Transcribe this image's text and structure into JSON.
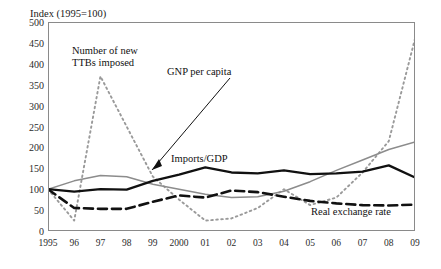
{
  "chart_data": {
    "type": "line",
    "title": "",
    "ylabel": "Index (1995=100)",
    "xlabel": "",
    "ylim": [
      0,
      500
    ],
    "yticks": [
      0,
      50,
      100,
      150,
      200,
      250,
      300,
      350,
      400,
      450,
      500
    ],
    "grid": false,
    "legend_position": "inline-annotations",
    "categories": [
      "1995",
      "96",
      "97",
      "98",
      "99",
      "2000",
      "01",
      "02",
      "03",
      "04",
      "05",
      "06",
      "07",
      "08",
      "09"
    ],
    "x": [
      1995,
      1996,
      1997,
      1998,
      1999,
      2000,
      2001,
      2002,
      2003,
      2004,
      2005,
      2006,
      2007,
      2008,
      2009
    ],
    "series": [
      {
        "name": "Number of new TTBs imposed",
        "style": "dotted",
        "color": "#9a9a9a",
        "values": [
          100,
          25,
          370,
          250,
          130,
          75,
          25,
          30,
          55,
          100,
          62,
          80,
          140,
          215,
          460
        ]
      },
      {
        "name": "GNP per capita",
        "style": "solid",
        "color": "#8c8c8c",
        "values": [
          100,
          120,
          133,
          130,
          112,
          100,
          88,
          80,
          82,
          95,
          118,
          145,
          170,
          195,
          213
        ]
      },
      {
        "name": "Imports/GDP",
        "style": "solid-bold",
        "color": "#111111",
        "values": [
          100,
          94,
          100,
          99,
          120,
          135,
          152,
          140,
          138,
          145,
          136,
          138,
          142,
          157,
          128
        ]
      },
      {
        "name": "Real exchange rate",
        "style": "dashed",
        "color": "#111111",
        "values": [
          100,
          55,
          53,
          53,
          70,
          85,
          80,
          97,
          93,
          82,
          72,
          66,
          62,
          61,
          63
        ]
      }
    ],
    "annotations": [
      {
        "id": "ttb",
        "text_line1": "Number of new",
        "text_line2": "TTBs imposed",
        "arrow": false
      },
      {
        "id": "gnp",
        "text_line1": "GNP per capita",
        "text_line2": "",
        "arrow": true
      },
      {
        "id": "imports",
        "text_line1": "Imports/GDP",
        "text_line2": "",
        "arrow": false
      },
      {
        "id": "rer",
        "text_line1": "Real exchange rate",
        "text_line2": "",
        "arrow": false
      }
    ]
  }
}
